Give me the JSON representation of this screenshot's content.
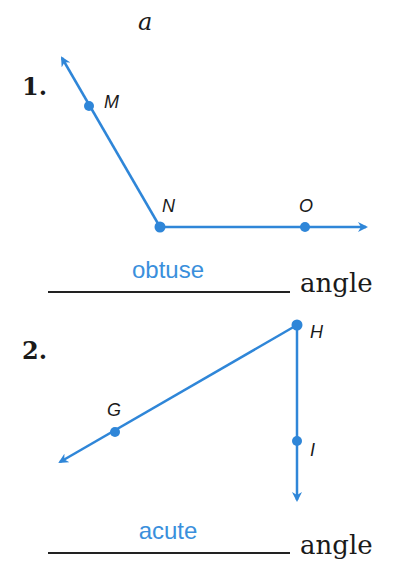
{
  "column_label": "a",
  "accent_color": "#2f86d8",
  "problems": [
    {
      "number": "1.",
      "points": [
        "M",
        "N",
        "O"
      ],
      "vertex": "N",
      "answer": "obtuse",
      "suffix": "angle"
    },
    {
      "number": "2.",
      "points": [
        "G",
        "H",
        "I"
      ],
      "vertex": "H",
      "answer": "acute",
      "suffix": "angle"
    }
  ]
}
